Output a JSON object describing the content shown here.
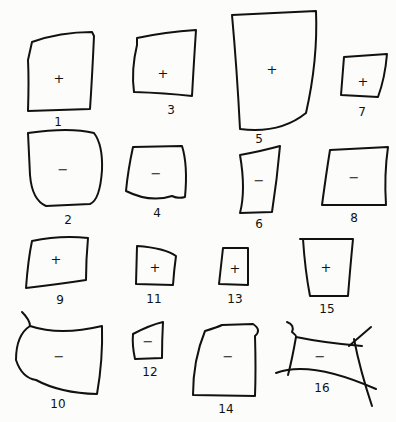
{
  "diagram": {
    "shapes": [
      {
        "id": 1,
        "label": "1",
        "sign": "+"
      },
      {
        "id": 2,
        "label": "2",
        "sign": "−"
      },
      {
        "id": 3,
        "label": "3",
        "sign": "+"
      },
      {
        "id": 4,
        "label": "4",
        "sign": "−"
      },
      {
        "id": 5,
        "label": "5",
        "sign": "+"
      },
      {
        "id": 6,
        "label": "6",
        "sign": "−"
      },
      {
        "id": 7,
        "label": "7",
        "sign": "+"
      },
      {
        "id": 8,
        "label": "8",
        "sign": "−"
      },
      {
        "id": 9,
        "label": "9",
        "sign": "+"
      },
      {
        "id": 10,
        "label": "10",
        "sign": "−"
      },
      {
        "id": 11,
        "label": "11",
        "sign": "+"
      },
      {
        "id": 12,
        "label": "12",
        "sign": "−"
      },
      {
        "id": 13,
        "label": "13",
        "sign": "+"
      },
      {
        "id": 14,
        "label": "14",
        "sign": "−"
      },
      {
        "id": 15,
        "label": "15",
        "sign": "+"
      },
      {
        "id": 16,
        "label": "16",
        "sign": "−"
      }
    ]
  }
}
